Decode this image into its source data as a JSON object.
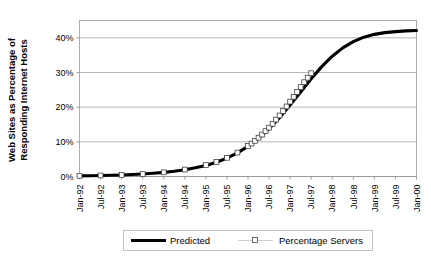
{
  "chart_data": {
    "type": "line",
    "title": "",
    "xlabel": "",
    "ylabel": "Web Sites as Percentage of Responding Internet Hosts",
    "ylabel_line1": "Web Sites as Percentage of",
    "ylabel_line2": "Responding Internet Hosts",
    "ylim": [
      0,
      45
    ],
    "ytick_values": [
      0,
      10,
      20,
      30,
      40
    ],
    "ytick_labels": [
      "0%",
      "10%",
      "20%",
      "30%",
      "40%"
    ],
    "grid": true,
    "grid_axis": "y",
    "legend_position": "bottom",
    "xlim": [
      "Jan-92",
      "Jan-00"
    ],
    "xtick_labels": [
      "Jan-92",
      "Jul-92",
      "Jan-93",
      "Jul-93",
      "Jan-94",
      "Jul-94",
      "Jan-95",
      "Jul-95",
      "Jan-96",
      "Jul-96",
      "Jan-97",
      "Jul-97",
      "Jan-98",
      "Jul-98",
      "Jan-99",
      "Jul-99",
      "Jan-00"
    ],
    "series": [
      {
        "name": "Predicted",
        "style": "thick-black-line",
        "color": "#000000",
        "x": [
          0,
          0.25,
          0.5,
          0.75,
          1,
          1.25,
          1.5,
          1.75,
          2,
          2.25,
          2.5,
          2.75,
          3,
          3.25,
          3.5,
          3.75,
          4,
          4.25,
          4.5,
          4.75,
          5,
          5.25,
          5.5,
          5.75,
          6,
          6.25,
          6.5,
          6.75,
          7,
          7.25,
          7.5,
          7.75,
          8
        ],
        "values": [
          0.18,
          0.22,
          0.28,
          0.35,
          0.45,
          0.56,
          0.72,
          0.92,
          1.18,
          1.5,
          1.95,
          2.5,
          3.2,
          4.1,
          5.3,
          6.8,
          8.7,
          11.0,
          13.8,
          17.0,
          20.6,
          24.4,
          28.2,
          31.7,
          34.7,
          37.1,
          38.9,
          40.2,
          41.0,
          41.5,
          41.8,
          42.0,
          42.1
        ]
      },
      {
        "name": "Percentage Servers",
        "style": "light-line-with-open-square-markers",
        "color": "#c9c9c9",
        "marker": "open-square",
        "x": [
          0,
          0.5,
          1,
          1.5,
          2,
          2.5,
          3,
          3.25,
          3.5,
          3.75,
          4,
          4.0833,
          4.1667,
          4.25,
          4.3333,
          4.4167,
          4.5,
          4.5833,
          4.6667,
          4.75,
          4.8333,
          4.9167,
          5,
          5.0833,
          5.1667,
          5.25,
          5.3333,
          5.4167,
          5.5
        ],
        "values": [
          0.2,
          0.3,
          0.45,
          0.7,
          1.2,
          2.0,
          3.3,
          4.2,
          5.4,
          6.9,
          8.8,
          9.5,
          10.3,
          11.2,
          12.1,
          13.1,
          14.1,
          15.2,
          16.4,
          17.6,
          18.9,
          20.2,
          21.6,
          23.0,
          24.4,
          25.8,
          27.2,
          28.5,
          29.8
        ]
      }
    ],
    "legend_entries": [
      {
        "label": "Predicted",
        "type": "line",
        "color": "#000000"
      },
      {
        "label": "Percentage Servers",
        "type": "line-marker",
        "color": "#c9c9c9"
      }
    ]
  },
  "legend": {
    "predicted_label": "Predicted",
    "servers_label": "Percentage Servers"
  },
  "axes": {
    "y_title_line1": "Web Sites as Percentage of",
    "y_title_line2": "Responding Internet Hosts"
  }
}
